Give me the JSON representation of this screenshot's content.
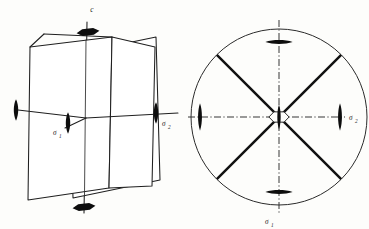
{
  "figure": {
    "background_color": "#fdfdfb",
    "ink_color": "#111111",
    "panels": [
      {
        "id": "perspective",
        "name": "three-dimensional perspective view",
        "description": "Two intersecting vertical mirror planes drawn in perspective, pierced by a vertical six-fold rotation axis labelled c, with two-fold rotation axes lying horizontally in the mirror planes.",
        "labels": [
          {
            "key": "axis_c",
            "base": "c",
            "sub": "",
            "x": 92,
            "y": 11
          },
          {
            "key": "axis_sigma1",
            "base": "σ",
            "sub": "1",
            "x": 54,
            "y": 133
          },
          {
            "key": "axis_sigma2",
            "base": "σ",
            "sub": "2",
            "x": 163,
            "y": 124
          }
        ],
        "symbols": [
          {
            "key": "six-fold-axis-top",
            "type": "hexagon-lens",
            "x": 88,
            "y": 32
          },
          {
            "key": "six-fold-axis-bottom",
            "type": "hexagon-lens",
            "x": 84,
            "y": 207
          },
          {
            "key": "two-fold-axis-left",
            "type": "vertical-lens",
            "x": 16,
            "y": 110
          },
          {
            "key": "two-fold-axis-sigma1",
            "type": "vertical-lens",
            "x": 68,
            "y": 123
          },
          {
            "key": "two-fold-axis-sigma2",
            "type": "vertical-lens",
            "x": 156,
            "y": 113
          }
        ]
      },
      {
        "id": "projection",
        "name": "stereographic projection view",
        "description": "A circle crossed by two thick diagonal mirror traces and by vertical and horizontal dash-dot lines, with two-fold axis lens symbols on the circumference and an open six-fold hexagon at the centre.",
        "circle": {
          "cx": 279,
          "cy": 117,
          "r": 88
        },
        "labels": [
          {
            "key": "proj_sigma1",
            "base": "σ",
            "sub": "1",
            "x": 268,
            "y": 222
          },
          {
            "key": "proj_sigma2",
            "base": "σ",
            "sub": "2",
            "x": 348,
            "y": 120
          }
        ],
        "symbols": [
          {
            "key": "two-fold-axis-north",
            "type": "horizontal-lens",
            "x": 279,
            "y": 42
          },
          {
            "key": "two-fold-axis-south",
            "type": "horizontal-lens",
            "x": 279,
            "y": 192
          },
          {
            "key": "two-fold-axis-west",
            "type": "vertical-lens",
            "x": 200,
            "y": 117
          },
          {
            "key": "two-fold-axis-east",
            "type": "vertical-lens",
            "x": 340,
            "y": 117
          },
          {
            "key": "six-fold-axis-centre",
            "type": "hexagon-lens-open",
            "x": 279,
            "y": 117
          }
        ],
        "mirror_traces": [
          {
            "key": "diagonal-trace-nw-se",
            "angle_deg": 45
          },
          {
            "key": "diagonal-trace-ne-sw",
            "angle_deg": 135
          }
        ],
        "dashdot_axes": [
          {
            "key": "vertical-dashdot-axis",
            "orientation": "vertical"
          },
          {
            "key": "horizontal-dashdot-axis",
            "orientation": "horizontal"
          }
        ]
      }
    ]
  }
}
